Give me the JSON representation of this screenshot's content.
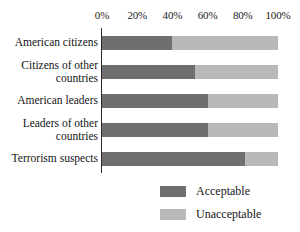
{
  "chart_data": {
    "type": "bar",
    "orientation": "horizontal",
    "stacked": true,
    "normalized_percent": true,
    "title": "",
    "subtitle": "",
    "xlabel": "",
    "ylabel": "",
    "xlim": [
      0,
      100
    ],
    "grid": false,
    "legend_position": "bottom-right",
    "categories": [
      "American citizens",
      "Citizens of other countries",
      "American leaders",
      "Leaders of other countries",
      "Terrorism suspects"
    ],
    "category_lines": [
      [
        "American citizens"
      ],
      [
        "Citizens of other",
        "countries"
      ],
      [
        "American leaders"
      ],
      [
        "Leaders of other",
        "countries"
      ],
      [
        "Terrorism suspects"
      ]
    ],
    "tick_labels": [
      "0%",
      "20%",
      "40%",
      "60%",
      "80%",
      "100%"
    ],
    "tick_values": [
      0,
      20,
      40,
      60,
      80,
      100
    ],
    "series": [
      {
        "name": "Acceptable",
        "color": "#706f70",
        "values": [
          40,
          53,
          60,
          60,
          81
        ]
      },
      {
        "name": "Unacceptable",
        "color": "#b9b9b9",
        "values": [
          60,
          47,
          40,
          40,
          19
        ]
      }
    ]
  },
  "legend": {
    "items": [
      {
        "label": "Acceptable",
        "color": "#706f70"
      },
      {
        "label": "Unacceptable",
        "color": "#b9b9b9"
      }
    ]
  },
  "axis": {
    "line_color": "#2a2a2a"
  }
}
